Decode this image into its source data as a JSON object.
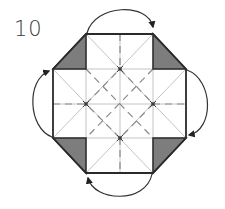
{
  "diagram": {
    "step_number": "10",
    "type": "origami-fold-step",
    "colors": {
      "outline": "#2a2a2a",
      "crease": "#b8b8b8",
      "valley": "#8a8a8a",
      "shade": "#7a7a7a",
      "arrow": "#333333"
    },
    "shaded_flaps": [
      "top-left",
      "top-right",
      "bottom-right",
      "bottom-left"
    ],
    "arrows": [
      {
        "from": "top-left",
        "to": "top-right",
        "position": "top"
      },
      {
        "from": "top-right",
        "to": "bottom-right",
        "position": "right"
      },
      {
        "from": "bottom-right",
        "to": "bottom-left",
        "position": "bottom"
      },
      {
        "from": "bottom-left",
        "to": "top-left",
        "position": "left"
      }
    ]
  }
}
